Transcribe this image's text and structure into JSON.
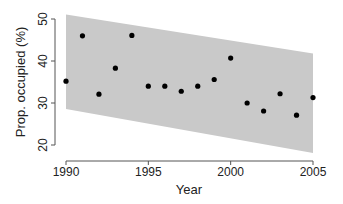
{
  "chart_data": {
    "type": "scatter",
    "title": "",
    "xlabel": "Year",
    "ylabel": "Prop. occupied (%)",
    "xlim": [
      1990,
      2005
    ],
    "ylim": [
      20,
      50
    ],
    "x_ticks": [
      1990,
      1995,
      2000,
      2005
    ],
    "y_ticks": [
      20,
      30,
      40,
      50
    ],
    "grid": false,
    "legend": null,
    "series": [
      {
        "name": "observed",
        "x": [
          1990,
          1991,
          1992,
          1993,
          1994,
          1995,
          1996,
          1997,
          1998,
          1999,
          2000,
          2001,
          2002,
          2003,
          2004,
          2005
        ],
        "values": [
          35.2,
          46.0,
          32.1,
          38.3,
          46.1,
          34.0,
          34.0,
          32.8,
          34.0,
          35.6,
          40.7,
          30.0,
          28.1,
          32.2,
          27.1,
          31.3
        ]
      }
    ],
    "band": {
      "name": "prediction interval",
      "x": [
        1990,
        2005
      ],
      "upper": [
        51.1,
        41.8
      ],
      "lower": [
        28.6,
        18.1
      ],
      "color": "#c9c9c9"
    },
    "colors": {
      "points": "#000000",
      "axis": "#555555"
    }
  }
}
